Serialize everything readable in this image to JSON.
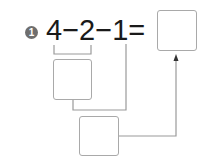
{
  "problem": {
    "number": "1",
    "expression": "4−2−1=",
    "operands": [
      "4",
      "2",
      "1"
    ],
    "operator": "−",
    "equals": "="
  },
  "boxes": {
    "step1": "",
    "step2": "",
    "answer": ""
  },
  "colors": {
    "badge": "#6e6e6e",
    "lines": "#9a9a9a",
    "box_border": "#a9a9a9",
    "text": "#1a1a1a"
  }
}
